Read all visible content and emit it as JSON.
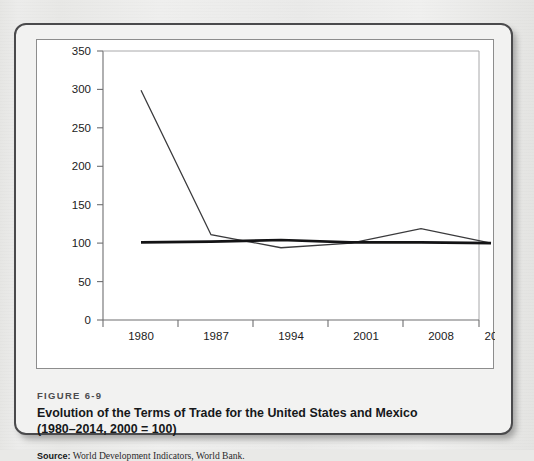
{
  "figure": {
    "number": "FIGURE 6-9",
    "title_line1": "Evolution of the Terms of Trade for the United States and Mexico",
    "title_line2": "(1980–2014, 2000  =  100)",
    "source_label": "Source:",
    "source_text": " World Development Indicators, World Bank."
  },
  "colors": {
    "frame_border": "#4a4a4c",
    "panel_border": "#8d8d8d",
    "axis": "#6e6e70",
    "mexico_line": "#3a3a3c",
    "us_line": "#131315",
    "page_background": "#e9e9e7",
    "panel_background": "#ffffff"
  },
  "chart_data": {
    "type": "line",
    "title": "Evolution of the Terms of Trade for the United States and Mexico (1980–2014, 2000 = 100)",
    "xlabel": "",
    "ylabel": "",
    "x": [
      "1980",
      "1987",
      "1994",
      "2001",
      "2008",
      "2015–16"
    ],
    "categories": [
      "1980",
      "1987",
      "1994",
      "2001",
      "2008",
      "2015–16"
    ],
    "series": [
      {
        "name": "Mexico",
        "values": [
          299,
          111,
          94,
          100,
          119,
          100
        ]
      },
      {
        "name": "United States",
        "values": [
          101,
          102,
          104,
          101,
          101,
          100
        ]
      }
    ],
    "ylim": [
      0,
      350
    ],
    "yticks": [
      0,
      50,
      100,
      150,
      200,
      250,
      300,
      350
    ],
    "ytick_labels": [
      "0",
      "50",
      "100",
      "150",
      "200",
      "250",
      "300",
      "350"
    ],
    "xtick_labels": [
      "1980",
      "1987",
      "1994",
      "2001",
      "2008",
      "2015–16"
    ],
    "grid": false,
    "legend": "none"
  }
}
